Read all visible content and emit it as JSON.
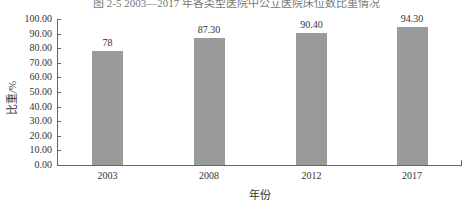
{
  "title": "图 2-5 2003—2017 年各类型医院中公立医院床位数比重情况",
  "chart_data": {
    "type": "bar",
    "title": "图 2-5 2003—2017 年各类型医院中公立医院床位数比重情况",
    "categories": [
      "2003",
      "2008",
      "2012",
      "2017"
    ],
    "values": [
      78,
      87.3,
      90.4,
      94.3
    ],
    "value_labels": [
      "78",
      "87.30",
      "90.40",
      "94.30"
    ],
    "xlabel": "年份",
    "ylabel": "比重/%",
    "ylim": [
      0,
      100
    ],
    "yticks": [
      "0.00",
      "10.00",
      "20.00",
      "30.00",
      "40.00",
      "50.00",
      "60.00",
      "70.00",
      "80.00",
      "90.00",
      "100.00"
    ],
    "grid": false,
    "legend": "none",
    "bar_color": "#9a9a9a"
  }
}
